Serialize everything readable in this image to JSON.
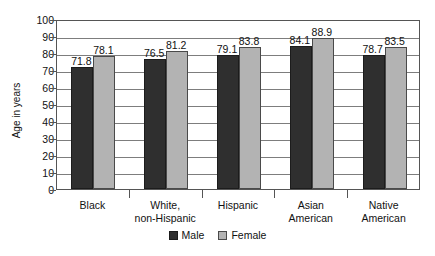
{
  "chart_data": {
    "type": "bar",
    "title": "",
    "subtitle": "",
    "xlabel": "",
    "ylabel": "Age in years",
    "ylim": [
      0,
      100
    ],
    "ytick_step": 10,
    "yticks": [
      100,
      90,
      80,
      70,
      60,
      50,
      40,
      30,
      20,
      10,
      0
    ],
    "grid": true,
    "grid_axis": "y",
    "legend_position": "bottom-center",
    "categories": [
      {
        "label_line1": "Black",
        "label_line2": ""
      },
      {
        "label_line1": "White,",
        "label_line2": "non-Hispanic"
      },
      {
        "label_line1": "Hispanic",
        "label_line2": ""
      },
      {
        "label_line1": "Asian",
        "label_line2": "American"
      },
      {
        "label_line1": "Native",
        "label_line2": "American"
      }
    ],
    "series": [
      {
        "name": "Male",
        "color": "#2f2f2f",
        "values": [
          71.8,
          76.5,
          79.1,
          84.1,
          78.7
        ],
        "value_labels": [
          "71.8",
          "76.5",
          "79.1",
          "84.1",
          "78.7"
        ]
      },
      {
        "name": "Female",
        "color": "#b3b3b3",
        "values": [
          78.1,
          81.2,
          83.8,
          88.9,
          83.5
        ],
        "value_labels": [
          "78.1",
          "81.2",
          "83.8",
          "88.9",
          "83.5"
        ]
      }
    ]
  }
}
